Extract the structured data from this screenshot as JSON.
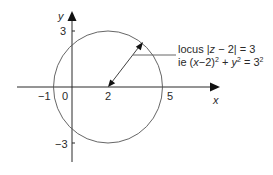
{
  "diagram": {
    "type": "argand-circle-locus",
    "axes": {
      "x_label": "x",
      "y_label": "y",
      "x_ticks": [
        "-1",
        "0",
        "2",
        "5"
      ],
      "y_ticks": [
        "3",
        "-3"
      ]
    },
    "circle": {
      "center": [
        2,
        0
      ],
      "radius": 3
    },
    "annotation": {
      "line1_prefix": "locus |",
      "line1_var": "z",
      "line1_suffix": " − 2| = 3",
      "line2_prefix": "ie (",
      "line2_var_x": "x",
      "line2_mid": "−2)",
      "line2_exp1": "2",
      "line2_plus": " + ",
      "line2_var_y": "y",
      "line2_exp2": "2",
      "line2_eq": " = 3",
      "line2_exp3": "2"
    },
    "labels": {
      "x_axis": "x",
      "y_axis": "y",
      "tick_neg1": "−1",
      "tick_0": "0",
      "tick_2": "2",
      "tick_5": "5",
      "tick_3": "3",
      "tick_neg3": "−3"
    },
    "colors": {
      "stroke": "#2a2a2a",
      "circle": "#555555",
      "background": "#ffffff"
    }
  }
}
